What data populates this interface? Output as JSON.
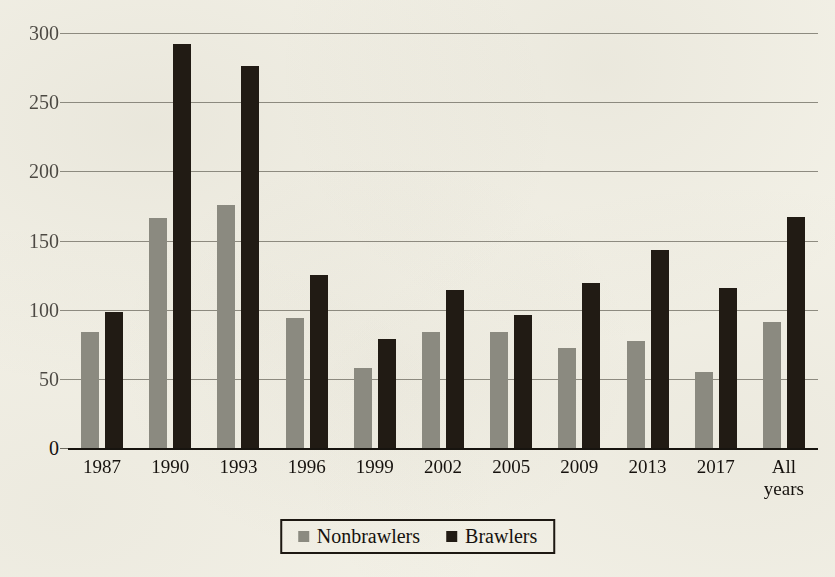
{
  "chart_data": {
    "type": "bar",
    "title": "",
    "xlabel": "",
    "ylabel": "",
    "ylim": [
      0,
      300
    ],
    "yticks": [
      0,
      50,
      100,
      150,
      200,
      250,
      300
    ],
    "ytick_labels": [
      "0",
      "50",
      "100",
      "150",
      "200",
      "250",
      "300"
    ],
    "grid": true,
    "legend_position": "bottom-center",
    "categories": [
      "1987",
      "1990",
      "1993",
      "1996",
      "1999",
      "2002",
      "2005",
      "2009",
      "2013",
      "2017",
      "All\nyears"
    ],
    "series": [
      {
        "name": "Nonbrawlers",
        "color": "#8b8a80",
        "values": [
          84,
          166,
          176,
          94,
          58,
          84,
          84,
          72,
          77,
          55,
          91
        ]
      },
      {
        "name": "Brawlers",
        "color": "#211b14",
        "values": [
          98,
          292,
          276,
          125,
          79,
          114,
          96,
          119,
          143,
          116,
          167
        ]
      }
    ]
  },
  "legend": {
    "entries": [
      {
        "label": "Nonbrawlers",
        "swatch": "gray-square-swatch"
      },
      {
        "label": "Brawlers",
        "swatch": "black-square-swatch"
      }
    ]
  },
  "colors": {
    "background": "#f3f1e7",
    "ink": "#16120e",
    "gridline": "#6d6a5f",
    "axis": "#17140f",
    "nonbrawlers": "#8b8a80",
    "brawlers": "#211b14"
  }
}
